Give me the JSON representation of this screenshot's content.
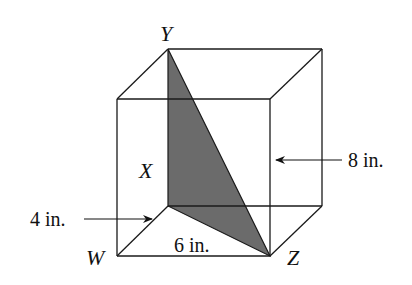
{
  "diagram": {
    "type": "rectangular prism with shaded triangle",
    "vertices": {
      "Y": "Y",
      "X": "X",
      "W": "W",
      "Z": "Z"
    },
    "dimensions": {
      "height": "8 in.",
      "depth": "4 in.",
      "width": "6 in."
    },
    "colors": {
      "shaded_triangle": "#6b6b6b",
      "edges": "#1a1a1a",
      "background": "#ffffff"
    }
  }
}
